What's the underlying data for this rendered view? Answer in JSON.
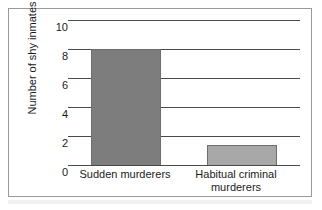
{
  "chart_data": {
    "type": "bar",
    "title": "",
    "subtitle": "",
    "xlabel": "",
    "ylabel": "Number of shy inmates",
    "categories": [
      "Sudden murderers",
      "Habitual criminal murderers"
    ],
    "category_lines": [
      [
        "Sudden murderers"
      ],
      [
        "Habitual criminal",
        "murderers"
      ]
    ],
    "values": [
      8,
      1.4
    ],
    "ylim": [
      0,
      10
    ],
    "yticks": [
      10,
      8,
      6,
      4,
      2,
      0
    ],
    "ytick_labels": [
      "10",
      "8",
      "6",
      "4",
      "2",
      "0"
    ],
    "grid": true,
    "grid_axis": "y",
    "legend": false,
    "legend_position": "none",
    "bar_colors": [
      "#7d7d7d",
      "#a8a8a8"
    ],
    "bar_border_color": "#6d6d6d",
    "axis_color": "#4a4a4a",
    "frame_color": "#9a9a9a",
    "background": "#ffffff",
    "text_color": "#1a1a1a",
    "annotations": []
  }
}
